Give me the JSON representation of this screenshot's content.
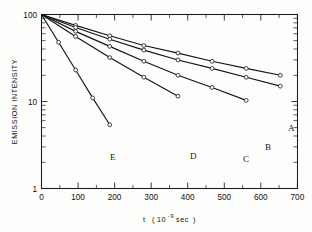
{
  "chart_data": {
    "type": "line",
    "title": "",
    "xlabel": "t (10-9 sec)",
    "xlabel_parts": {
      "symbol": "t",
      "open": "(",
      "base": "10",
      "exponent": "-9",
      "unit": "sec",
      "close": ")"
    },
    "ylabel": "EMISSION INTENSITY",
    "xlim": [
      0,
      750
    ],
    "ylim": [
      1,
      100
    ],
    "yscale": "log",
    "xscale": "linear",
    "grid": false,
    "legend": "inline-curve-labels",
    "xticks": [
      0,
      100,
      200,
      300,
      400,
      500,
      600,
      700
    ],
    "xticklabels": [
      "0",
      "100",
      "200",
      "300",
      "400",
      "500",
      "600",
      "700"
    ],
    "xminor_step": 50,
    "yticks": [
      1,
      10,
      100
    ],
    "yticklabels": [
      "1",
      "10",
      "100"
    ],
    "marker": "open-circle",
    "series": [
      {
        "name": "A",
        "label": "A",
        "x": [
          0,
          100,
          200,
          300,
          400,
          500,
          600,
          700
        ],
        "y": [
          100,
          75,
          57,
          44,
          36,
          29,
          24,
          20
        ]
      },
      {
        "name": "B",
        "label": "B",
        "x": [
          0,
          100,
          200,
          300,
          400,
          500,
          600,
          700
        ],
        "y": [
          100,
          71,
          52,
          39,
          30,
          24,
          19,
          15
        ]
      },
      {
        "name": "C",
        "label": "C",
        "x": [
          0,
          100,
          200,
          300,
          400,
          500,
          600
        ],
        "y": [
          100,
          64,
          43,
          29,
          20,
          14.5,
          10.3
        ]
      },
      {
        "name": "D",
        "label": "D",
        "x": [
          0,
          100,
          200,
          300,
          400
        ],
        "y": [
          100,
          56,
          32,
          19,
          11.5
        ]
      },
      {
        "name": "E",
        "label": "E",
        "x": [
          0,
          50,
          100,
          150,
          200
        ],
        "y": [
          100,
          48,
          23,
          11,
          5.4
        ]
      }
    ]
  },
  "figure": {
    "ylabel": "EMISSION INTENSITY",
    "ytick_top": "100",
    "ytick_mid": "10",
    "ytick_bottom": "1",
    "xtick_0": "0",
    "xtick_100": "100",
    "xtick_200": "200",
    "xtick_300": "300",
    "xtick_400": "400",
    "xtick_500": "500",
    "xtick_600": "600",
    "xtick_700": "700",
    "xaxis_symbol": "t",
    "xaxis_paren_open": "(",
    "xaxis_base": "10",
    "xaxis_exp": "-9",
    "xaxis_unit": "sec",
    "xaxis_paren_close": ")",
    "label_a": "A",
    "label_b": "B",
    "label_c": "C",
    "label_d": "D",
    "label_e": "E"
  }
}
